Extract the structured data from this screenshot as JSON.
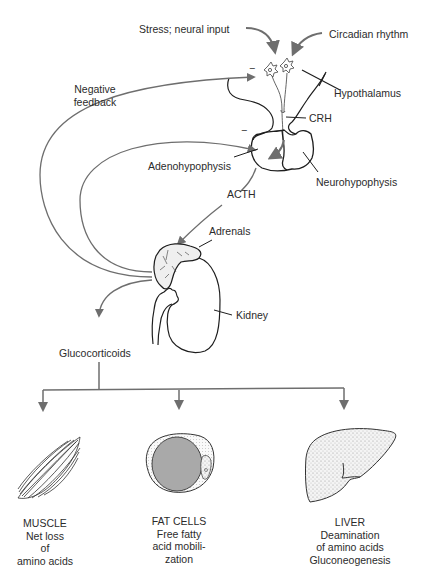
{
  "figure": {
    "header_fragment": "(cropped running header)",
    "inputs": {
      "stress": "Stress; neural input",
      "circadian": "Circadian rhythm"
    },
    "labels": {
      "negative_feedback_line1": "Negative",
      "negative_feedback_line2": "feedback",
      "hypothalamus": "Hypothalamus",
      "crh": "CRH",
      "adenohypophysis": "Adenohypophysis",
      "neurohypophysis": "Neurohypophysis",
      "acth": "ACTH",
      "adrenals": "Adrenals",
      "kidney": "Kidney",
      "glucocorticoids": "Glucocorticoids",
      "minus_sign": "−"
    },
    "targets": [
      {
        "name": "MUSCLE",
        "lines": [
          "Net loss",
          "of",
          "amino acids"
        ]
      },
      {
        "name": "FAT CELLS",
        "lines": [
          "Free fatty",
          "acid mobili-",
          "zation"
        ]
      },
      {
        "name": "LIVER",
        "lines": [
          "Deamination",
          "of amino acids",
          "Gluconeogenesis"
        ]
      }
    ],
    "colors": {
      "arrow": "#6e6e6e",
      "outline": "#1e1e1e",
      "fat_droplet": "#a9a9a9",
      "liver_stipple": "#c9c9c9"
    }
  }
}
